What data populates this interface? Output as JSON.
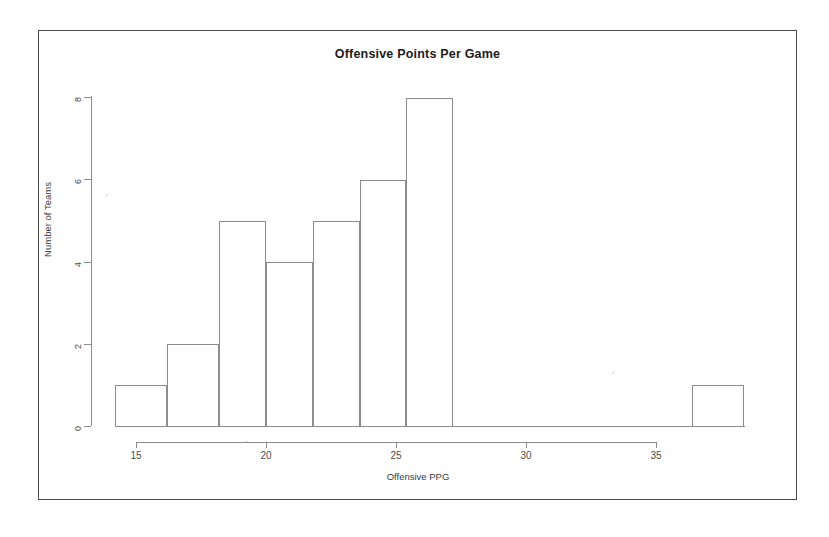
{
  "figure": {
    "title": "Offensive Points Per Game",
    "xlabel": "Offensive PPG",
    "ylabel": "Number of Teams"
  },
  "chart_data": {
    "type": "bar",
    "title": "Offensive Points Per Game",
    "xlabel": "Offensive PPG",
    "ylabel": "Number of Teams",
    "xlim": [
      14.2,
      38.5
    ],
    "ylim": [
      0,
      8
    ],
    "xticks": [
      15,
      20,
      25,
      30,
      35
    ],
    "yticks": [
      0,
      2,
      4,
      6,
      8
    ],
    "grid": false,
    "legend": null,
    "bin_width": 2,
    "bins": [
      {
        "label": "14.2-16.2",
        "x_start": 14.2,
        "x_end": 16.2,
        "count": 1
      },
      {
        "label": "16.2-18.2",
        "x_start": 16.2,
        "x_end": 18.2,
        "count": 2
      },
      {
        "label": "18.2-20.0",
        "x_start": 18.2,
        "x_end": 20.0,
        "count": 5
      },
      {
        "label": "20.0-21.8",
        "x_start": 20.0,
        "x_end": 21.8,
        "count": 4
      },
      {
        "label": "21.8-23.6",
        "x_start": 21.8,
        "x_end": 23.6,
        "count": 5
      },
      {
        "label": "23.6-25.4",
        "x_start": 23.6,
        "x_end": 25.4,
        "count": 6
      },
      {
        "label": "25.4-27.2",
        "x_start": 25.4,
        "x_end": 27.2,
        "count": 8
      },
      {
        "label": "36.4-38.4",
        "x_start": 36.4,
        "x_end": 38.4,
        "count": 1
      }
    ],
    "categories": [
      "14.2-16.2",
      "16.2-18.2",
      "18.2-20.0",
      "20.0-21.8",
      "21.8-23.6",
      "23.6-25.4",
      "25.4-27.2",
      "36.4-38.4"
    ],
    "values": [
      1,
      2,
      5,
      4,
      5,
      6,
      8,
      1
    ]
  },
  "axes": {
    "y_tick_labels": [
      "0",
      "2",
      "4",
      "6",
      "8"
    ],
    "x_tick_labels": [
      "15",
      "20",
      "25",
      "30",
      "35"
    ]
  },
  "colors": {
    "bar_stroke": "#8d8d8d",
    "axis": "#8a8a8a",
    "frame": "#4a4a4a",
    "text": "#1c1c1c",
    "background": "#ffffff"
  }
}
